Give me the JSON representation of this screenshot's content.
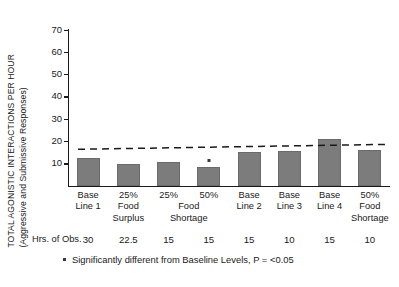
{
  "chart_data": {
    "type": "bar",
    "title": "",
    "xlabel": "",
    "ylabel": "TOTAL AGONISTIC INTERACTIONS PER HOUR",
    "ylabel_sub": "(Aggressive and Submissive Responses)",
    "ylim": [
      0,
      70
    ],
    "yticks": [
      10,
      20,
      30,
      40,
      50,
      60,
      70
    ],
    "grid": false,
    "legend": "none",
    "categories": [
      "Base Line 1",
      "25% Food Surplus",
      "25% Food Shortage",
      "50% Food Shortage",
      "Base Line 2",
      "Base Line 3",
      "Base Line 4",
      "50% Food Shortage"
    ],
    "category_lines": [
      [
        "Base",
        "Line 1"
      ],
      [
        "25%",
        "Food",
        "Surplus"
      ],
      [
        "25%",
        "",
        ""
      ],
      [
        "50%",
        "",
        ""
      ],
      [
        "Base",
        "Line 2"
      ],
      [
        "Base",
        "Line 3"
      ],
      [
        "Base",
        "Line 4"
      ],
      [
        "50%",
        "Food",
        "Shortage"
      ]
    ],
    "spanning_labels": [
      {
        "text": "Food",
        "start_index": 2,
        "end_index": 3,
        "line": 2
      },
      {
        "text": "Shortage",
        "start_index": 2,
        "end_index": 3,
        "line": 3
      }
    ],
    "values": [
      12.5,
      9.5,
      10.5,
      8.5,
      15.0,
      15.5,
      21.0,
      16.0
    ],
    "significant_markers": [
      3
    ],
    "baseline_trend": {
      "label": "baseline trend",
      "style": "dashed",
      "y_start": 16.3,
      "y_end": 18.5
    },
    "hours_row_label": "Hrs. of Obs.",
    "hours_of_observation": [
      "30",
      "22.5",
      "15",
      "15",
      "15",
      "10",
      "15",
      "10"
    ],
    "footnote": "Significantly different from Baseline Levels, P = <0.05",
    "bar_color": "#7c7c7c",
    "axis_color": "#1a1a1a",
    "background": "#ffffff"
  }
}
